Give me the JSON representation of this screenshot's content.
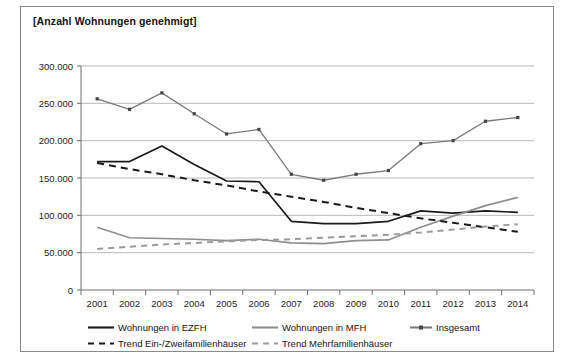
{
  "chart_data": {
    "type": "line",
    "title": "[Anzahl Wohnungen genehmigt]",
    "xlabel": "",
    "ylabel": "",
    "ylim": [
      0,
      300000
    ],
    "ytick_labels": [
      "300.000",
      "250.000",
      "200.000",
      "150.000",
      "100.000",
      "50.000",
      "0"
    ],
    "ytick_values": [
      300000,
      250000,
      200000,
      150000,
      100000,
      50000,
      0
    ],
    "grid": true,
    "legend_position": "bottom",
    "categories": [
      2001,
      2002,
      2003,
      2004,
      2005,
      2006,
      2007,
      2008,
      2009,
      2010,
      2011,
      2012,
      2013,
      2014
    ],
    "xtick_labels": [
      "2001",
      "2002",
      "2003",
      "2004",
      "2005",
      "2006",
      "2007",
      "2008",
      "2009",
      "2010",
      "2011",
      "2012",
      "2013",
      "2014"
    ],
    "series": [
      {
        "name": "Wohnungen in EZFH",
        "style": "solid",
        "color": "#1a1a1a",
        "markers": false,
        "values": [
          172000,
          172000,
          193000,
          168000,
          146000,
          145000,
          92000,
          89000,
          89000,
          92000,
          106000,
          103000,
          106000,
          104000
        ]
      },
      {
        "name": "Wohnungen in MFH",
        "style": "solid",
        "color": "#8e8e8e",
        "markers": false,
        "values": [
          84000,
          70000,
          69000,
          68000,
          66000,
          68000,
          63000,
          62000,
          66000,
          67000,
          84000,
          99000,
          113000,
          124000
        ]
      },
      {
        "name": "Insgesamt",
        "style": "solid",
        "color": "#7a7a7a",
        "markers": true,
        "values": [
          256000,
          242000,
          264000,
          236000,
          209000,
          215000,
          155000,
          147000,
          155000,
          160000,
          196000,
          200000,
          226000,
          231000
        ]
      },
      {
        "name": "Trend Ein-/Zweifamilienhäuser",
        "style": "dashed",
        "color": "#1a1a1a",
        "markers": false,
        "values": [
          170000,
          162000,
          155000,
          147000,
          140000,
          132000,
          125000,
          118000,
          110000,
          103000,
          96000,
          90000,
          84000,
          78000
        ]
      },
      {
        "name": "Trend Mehrfamilienhäuser",
        "style": "dashed",
        "color": "#9a9a9a",
        "markers": false,
        "values": [
          55000,
          58000,
          61000,
          63000,
          65000,
          67000,
          68000,
          70000,
          72000,
          74000,
          77000,
          81000,
          85000,
          88000
        ]
      }
    ],
    "legend": [
      {
        "label": "Wohnungen in EZFH",
        "style": "solid",
        "color": "#1a1a1a",
        "markers": false
      },
      {
        "label": "Wohnungen in MFH",
        "style": "solid",
        "color": "#8e8e8e",
        "markers": false
      },
      {
        "label": "Insgesamt",
        "style": "solid",
        "color": "#7a7a7a",
        "markers": true
      },
      {
        "label": "Trend Ein-/Zweifamilienhäuser",
        "style": "dashed",
        "color": "#1a1a1a",
        "markers": false
      },
      {
        "label": "Trend Mehrfamilienhäuser",
        "style": "dashed",
        "color": "#9a9a9a",
        "markers": false
      }
    ]
  }
}
